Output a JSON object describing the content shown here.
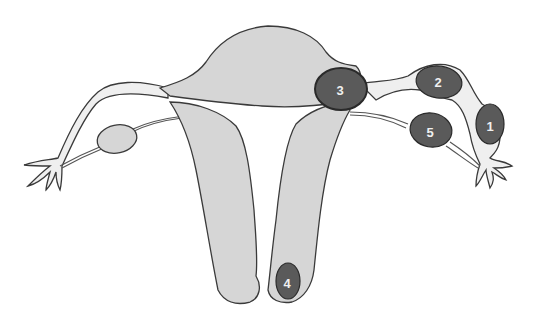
{
  "diagram": {
    "title": "",
    "colors": {
      "organ_fill": "#d6d6d6",
      "tube_fill": "#efefef",
      "outline": "#3a3a3a",
      "site_fill": "#5a5a5a",
      "label_text": "#f0f0f0"
    },
    "sites": [
      {
        "id": "1",
        "label": "1",
        "location": "fimbrial/infundibular tube (right)"
      },
      {
        "id": "2",
        "label": "2",
        "location": "ampullary tube (right)"
      },
      {
        "id": "3",
        "label": "3",
        "location": "interstitial/cornual"
      },
      {
        "id": "4",
        "label": "4",
        "location": "cervix"
      },
      {
        "id": "5",
        "label": "5",
        "location": "ovary (right)"
      }
    ]
  }
}
